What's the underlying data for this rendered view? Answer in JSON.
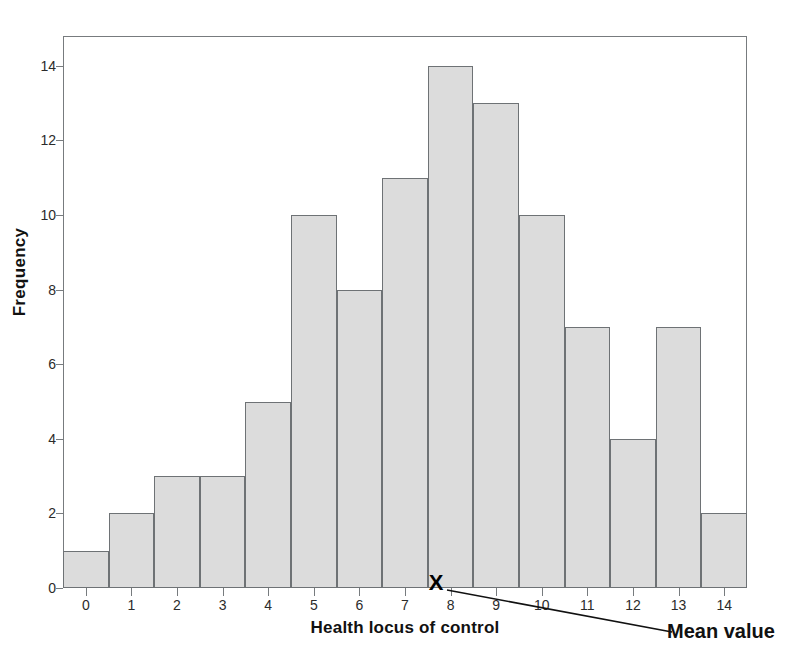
{
  "chart_data": {
    "type": "bar",
    "title": "",
    "subtitle": "",
    "xlabel": "Health locus of control",
    "ylabel": "Frequency",
    "categories": [
      "0",
      "1",
      "2",
      "3",
      "4",
      "5",
      "6",
      "7",
      "8",
      "9",
      "10",
      "11",
      "12",
      "13",
      "14"
    ],
    "values": [
      1,
      2,
      3,
      3,
      5,
      10,
      8,
      11,
      14,
      13,
      10,
      7,
      4,
      7,
      2
    ],
    "xlim": [
      -0.5,
      14.5
    ],
    "ylim": [
      0,
      14.8
    ],
    "x_ticks": [
      "0",
      "1",
      "2",
      "3",
      "4",
      "5",
      "6",
      "7",
      "8",
      "9",
      "10",
      "11",
      "12",
      "13",
      "14"
    ],
    "y_ticks": [
      "0",
      "2",
      "4",
      "6",
      "8",
      "10",
      "12",
      "14"
    ],
    "y_tick_values": [
      0,
      2,
      4,
      6,
      8,
      10,
      12,
      14
    ],
    "grid": false,
    "legend": "none",
    "bar_fill_color": "#dcdcdc",
    "bar_edge_color": "#6e7275",
    "frame_color": "#777b7e",
    "annotations": [
      {
        "name": "mean-value",
        "marker": "X",
        "label": "Mean value",
        "x_value": 7.72,
        "y_value": 0
      }
    ]
  },
  "axes": {
    "y": {
      "label": "Frequency",
      "ticks": [
        "14",
        "12",
        "10",
        "8",
        "6",
        "4",
        "2",
        "0"
      ]
    },
    "x": {
      "label": "Health locus of control",
      "ticks": [
        "0",
        "1",
        "2",
        "3",
        "4",
        "5",
        "6",
        "7",
        "8",
        "9",
        "10",
        "11",
        "12",
        "13",
        "14"
      ]
    }
  },
  "annotation": {
    "marker_glyph": "X",
    "mean_label": "Mean value"
  }
}
